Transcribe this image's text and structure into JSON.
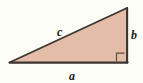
{
  "figure": {
    "kind": "right-triangle-diagram",
    "background_color": "#fdfdf7",
    "canvas": {
      "width": 143,
      "height": 83
    },
    "triangle": {
      "fill_color": "#e3bda8",
      "stroke_color": "#3a3330",
      "vertices": {
        "bottom_left": {
          "x": 10,
          "y": 62
        },
        "bottom_right": {
          "x": 127,
          "y": 62
        },
        "top_right": {
          "x": 127,
          "y": 8
        }
      }
    },
    "right_angle_marker": {
      "present": true,
      "corner": "bottom-right",
      "stroke_color": "#4a423e",
      "size": 9
    },
    "labels": {
      "hypotenuse": "c",
      "vertical_leg": "b",
      "horizontal_leg": "a"
    }
  }
}
